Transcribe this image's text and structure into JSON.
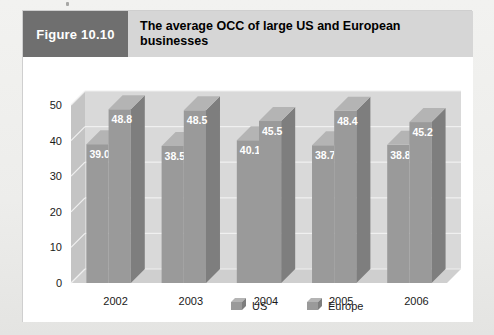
{
  "figure": {
    "number_label": "Figure 10.10",
    "title": "The average OCC of large US and European businesses"
  },
  "colors": {
    "figure_number_bg": "#6f6f6f",
    "figure_title_bg": "#d6d6d6",
    "panel_bg": "#ffffff",
    "page_bg": "#ededeb",
    "plot_back_wall": "#d9d9d9",
    "plot_floor": "#cfcfcf",
    "plot_side_wall": "#c4c4c4",
    "bar_front": "#9a9a9a",
    "bar_side": "#7e7e7e",
    "bar_top": "#b4b4b4",
    "gridline": "#f0f0f0",
    "value_label": "#ffffff",
    "axis_text": "#1a1a1a"
  },
  "chart_data": {
    "type": "bar",
    "title": "The average OCC of large US and European businesses",
    "xlabel": "",
    "ylabel": "",
    "ylim": [
      0,
      50
    ],
    "yticks": [
      "0",
      "10",
      "20",
      "30",
      "40",
      "50"
    ],
    "ytick_values": [
      0,
      10,
      20,
      30,
      40,
      50
    ],
    "grid": true,
    "legend_position": "bottom",
    "three_d": true,
    "categories": [
      "2002",
      "2003",
      "2004",
      "2005",
      "2006"
    ],
    "series": [
      {
        "name": "US",
        "values": [
          39.0,
          38.5,
          40.1,
          38.7,
          38.8
        ],
        "labels": [
          "39.0",
          "38.5",
          "40.1",
          "38.7",
          "38.8"
        ]
      },
      {
        "name": "Europe",
        "values": [
          48.8,
          48.5,
          45.5,
          48.4,
          45.2
        ],
        "labels": [
          "48.8",
          "48.5",
          "45.5",
          "48.4",
          "45.2"
        ]
      }
    ]
  },
  "legend": {
    "items": [
      {
        "label": "US"
      },
      {
        "label": "Europe"
      }
    ]
  }
}
